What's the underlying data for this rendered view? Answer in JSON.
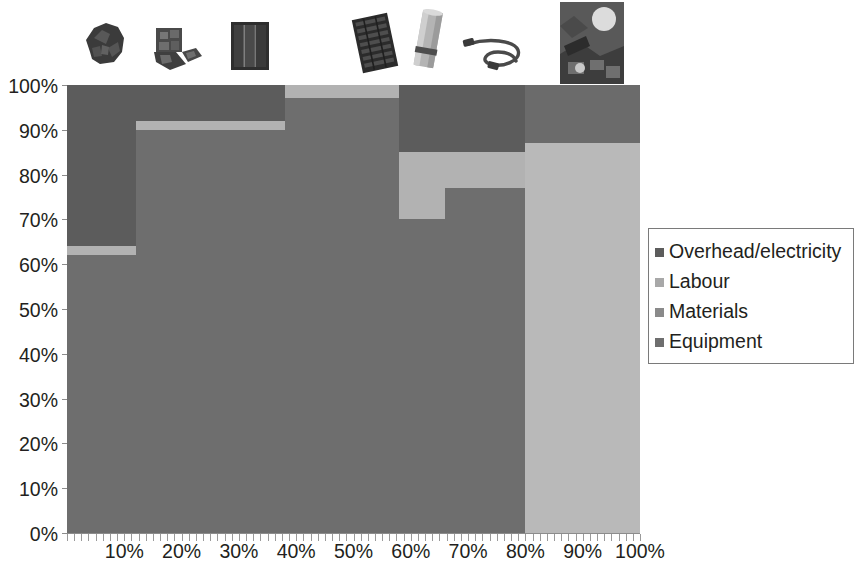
{
  "chart_data": {
    "type": "bar",
    "subtype": "marimekko-100pct-stacked",
    "title": "",
    "xlabel": "",
    "ylabel": "",
    "xlim": [
      0,
      100
    ],
    "ylim": [
      0,
      100
    ],
    "grid": false,
    "legend_position": "right",
    "y_tick_labels": [
      "0%",
      "10%",
      "20%",
      "30%",
      "40%",
      "50%",
      "60%",
      "70%",
      "80%",
      "90%",
      "100%"
    ],
    "y_tick_values": [
      0,
      10,
      20,
      30,
      40,
      50,
      60,
      70,
      80,
      90,
      100
    ],
    "x_tick_labels": [
      "10%",
      "20%",
      "30%",
      "40%",
      "50%",
      "60%",
      "70%",
      "80%",
      "90%",
      "100%"
    ],
    "x_tick_values": [
      10,
      20,
      30,
      40,
      50,
      60,
      70,
      80,
      90,
      100
    ],
    "series": [
      {
        "name": "Equipment",
        "color": "#6e6e6e",
        "values": [
          62,
          91,
          91,
          97,
          70,
          77,
          0
        ]
      },
      {
        "name": "Materials",
        "color": "#b2b2b2",
        "values": [
          2,
          2,
          2,
          3,
          15,
          8,
          87
        ]
      },
      {
        "name": "Labour",
        "color": "#8a8a8a",
        "values": [
          0,
          0,
          0,
          0,
          0,
          0,
          0
        ]
      },
      {
        "name": "Overhead/electricity",
        "color": "#5a5a5a",
        "values": [
          36,
          7,
          7,
          0,
          15,
          15,
          13
        ]
      }
    ],
    "columns": [
      {
        "index": 1,
        "x_start": 0,
        "x_end": 12,
        "width_pct": 12,
        "segments": [
          {
            "name": "Equipment",
            "from": 0,
            "to": 62,
            "pct": 62,
            "color": "#6e6e6e"
          },
          {
            "name": "Materials",
            "from": 62,
            "to": 64,
            "pct": 2,
            "color": "#b2b2b2"
          },
          {
            "name": "Overhead/electricity",
            "from": 64,
            "to": 100,
            "pct": 36,
            "color": "#5c5c5c"
          }
        ]
      },
      {
        "index": 2,
        "x_start": 12,
        "x_end": 26,
        "width_pct": 14,
        "segments": [
          {
            "name": "Equipment",
            "from": 0,
            "to": 90,
            "pct": 90,
            "color": "#6e6e6e"
          },
          {
            "name": "Materials",
            "from": 90,
            "to": 92,
            "pct": 2,
            "color": "#b2b2b2"
          },
          {
            "name": "Overhead/electricity",
            "from": 92,
            "to": 100,
            "pct": 8,
            "color": "#5c5c5c"
          }
        ]
      },
      {
        "index": 3,
        "x_start": 26,
        "x_end": 38,
        "width_pct": 12,
        "segments": [
          {
            "name": "Equipment",
            "from": 0,
            "to": 90,
            "pct": 90,
            "color": "#6e6e6e"
          },
          {
            "name": "Materials",
            "from": 90,
            "to": 92,
            "pct": 2,
            "color": "#b2b2b2"
          },
          {
            "name": "Overhead/electricity",
            "from": 92,
            "to": 100,
            "pct": 8,
            "color": "#5c5c5c"
          }
        ]
      },
      {
        "index": 4,
        "x_start": 38,
        "x_end": 58,
        "width_pct": 20,
        "segments": [
          {
            "name": "Equipment",
            "from": 0,
            "to": 97,
            "pct": 97,
            "color": "#6e6e6e"
          },
          {
            "name": "Materials",
            "from": 97,
            "to": 100,
            "pct": 3,
            "color": "#b2b2b2"
          }
        ]
      },
      {
        "index": 5,
        "x_start": 58,
        "x_end": 66,
        "width_pct": 8,
        "segments": [
          {
            "name": "Equipment",
            "from": 0,
            "to": 70,
            "pct": 70,
            "color": "#6e6e6e"
          },
          {
            "name": "Materials",
            "from": 70,
            "to": 85,
            "pct": 15,
            "color": "#b2b2b2"
          },
          {
            "name": "Overhead/electricity",
            "from": 85,
            "to": 100,
            "pct": 15,
            "color": "#5c5c5c"
          }
        ]
      },
      {
        "index": 6,
        "x_start": 66,
        "x_end": 80,
        "width_pct": 14,
        "segments": [
          {
            "name": "Equipment",
            "from": 0,
            "to": 77,
            "pct": 77,
            "color": "#6e6e6e"
          },
          {
            "name": "Materials",
            "from": 77,
            "to": 85,
            "pct": 8,
            "color": "#b2b2b2"
          },
          {
            "name": "Overhead/electricity",
            "from": 85,
            "to": 100,
            "pct": 15,
            "color": "#5c5c5c"
          }
        ]
      },
      {
        "index": 7,
        "x_start": 80,
        "x_end": 100,
        "width_pct": 20,
        "segments": [
          {
            "name": "Materials",
            "from": 0,
            "to": 87,
            "pct": 87,
            "color": "#b9b9b9"
          },
          {
            "name": "Overhead/electricity",
            "from": 87,
            "to": 100,
            "pct": 13,
            "color": "#6b6b6b"
          }
        ]
      }
    ]
  },
  "legend": {
    "items": [
      {
        "label": "Overhead/electricity",
        "color": "#5c5c5c"
      },
      {
        "label": "Labour",
        "color": "#a8a8a8"
      },
      {
        "label": "Materials",
        "color": "#8a8a8a"
      },
      {
        "label": "Equipment",
        "color": "#6e6e6e"
      }
    ]
  },
  "thumbnails": [
    {
      "icon": "silicon-rock-icon",
      "alt": "quartz silicon rock"
    },
    {
      "icon": "polysilicon-chunks-icon",
      "alt": "polysilicon chunks"
    },
    {
      "icon": "silicon-ingot-icon",
      "alt": "silicon ingot wafer block"
    },
    {
      "icon": "solar-cell-icon",
      "alt": "solar cell"
    },
    {
      "icon": "aluminium-roll-icon",
      "alt": "aluminium frame roll"
    },
    {
      "icon": "cable-icon",
      "alt": "power cable"
    },
    {
      "icon": "pv-installation-icon",
      "alt": "installed pv system"
    }
  ],
  "colors": {
    "equipment": "#6e6e6e",
    "materials": "#b2b2b2",
    "labour": "#a8a8a8",
    "overhead": "#5c5c5c",
    "axis": "#8c8c8c",
    "text": "#231f20",
    "background": "#ffffff"
  }
}
